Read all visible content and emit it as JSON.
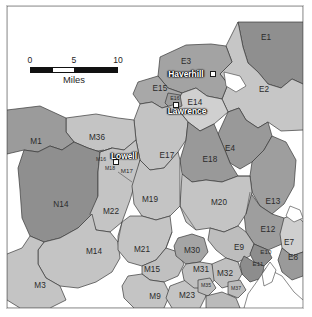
{
  "map": {
    "title": "Regional planning area map",
    "background_color": "#ffffff",
    "frame_color": "#c9c9c9",
    "boundary_color": "#3a3a3a",
    "water_color": "#ffffff",
    "palette": {
      "dark_gray": "#8f8f8f",
      "mid_gray": "#a3a3a3",
      "light_gray": "#bdbdbd",
      "pale_gray": "#cfcfcf",
      "very_light": "#d8d8d8"
    }
  },
  "scale_bar": {
    "ticks": [
      "0",
      "5",
      "10"
    ],
    "caption": "Miles",
    "units": "Miles",
    "max_value": 10
  },
  "cities": [
    {
      "name": "Haverhill",
      "x": 186,
      "y": 74,
      "dot_x": 213,
      "dot_y": 74
    },
    {
      "name": "Lawrence",
      "x": 187,
      "y": 111,
      "dot_x": 176,
      "dot_y": 105
    },
    {
      "name": "Lowell",
      "x": 124,
      "y": 156,
      "dot_x": 116,
      "dot_y": 162
    }
  ],
  "regions": [
    {
      "id": "E1",
      "label": "E1",
      "x": 266,
      "y": 38,
      "fill": "#8f8f8f",
      "size": "md"
    },
    {
      "id": "E2",
      "label": "E2",
      "x": 264,
      "y": 90,
      "fill": "#c6c6c6",
      "size": "md"
    },
    {
      "id": "E3",
      "label": "E3",
      "x": 186,
      "y": 62,
      "fill": "#a3a3a3",
      "size": "md"
    },
    {
      "id": "E4",
      "label": "E4",
      "x": 230,
      "y": 149,
      "fill": "#999999",
      "size": "md"
    },
    {
      "id": "E7",
      "label": "E7",
      "x": 289,
      "y": 243,
      "fill": "#cfcfcf",
      "size": "md"
    },
    {
      "id": "E8",
      "label": "E8",
      "x": 293,
      "y": 258,
      "fill": "#9a9a9a",
      "size": "md"
    },
    {
      "id": "E9",
      "label": "E9",
      "x": 239,
      "y": 248,
      "fill": "#bdbdbd",
      "size": "md"
    },
    {
      "id": "E10",
      "label": "E10",
      "x": 266,
      "y": 252,
      "fill": "#8d8d8d",
      "size": "sm"
    },
    {
      "id": "E11",
      "label": "E11",
      "x": 258,
      "y": 264,
      "fill": "#8d8d8d",
      "size": "sm"
    },
    {
      "id": "E12",
      "label": "E12",
      "x": 268,
      "y": 230,
      "fill": "#9e9e9e",
      "size": "md"
    },
    {
      "id": "E13",
      "label": "E13",
      "x": 273,
      "y": 202,
      "fill": "#9e9e9e",
      "size": "md"
    },
    {
      "id": "E14",
      "label": "E14",
      "x": 195,
      "y": 103,
      "fill": "#d0d0d0",
      "size": "md"
    },
    {
      "id": "E15",
      "label": "E15",
      "x": 160,
      "y": 89,
      "fill": "#a8a8a8",
      "size": "md"
    },
    {
      "id": "E16",
      "label": "E16",
      "x": 175,
      "y": 99,
      "fill": "#9d9d9d",
      "size": "xs"
    },
    {
      "id": "E17",
      "label": "E17",
      "x": 167,
      "y": 156,
      "fill": "#c3c3c3",
      "size": "md"
    },
    {
      "id": "E18",
      "label": "E18",
      "x": 210,
      "y": 160,
      "fill": "#999999",
      "size": "md"
    },
    {
      "id": "M1",
      "label": "M1",
      "x": 36,
      "y": 142,
      "fill": "#9b9b9b",
      "size": "md"
    },
    {
      "id": "M3",
      "label": "M3",
      "x": 40,
      "y": 286,
      "fill": "#c4c4c4",
      "size": "md"
    },
    {
      "id": "M9",
      "label": "M9",
      "x": 155,
      "y": 297,
      "fill": "#c4c4c4",
      "size": "md"
    },
    {
      "id": "M14",
      "label": "M14",
      "x": 94,
      "y": 252,
      "fill": "#c4c4c4",
      "size": "md"
    },
    {
      "id": "M15",
      "label": "M15",
      "x": 152,
      "y": 270,
      "fill": "#c0c0c0",
      "size": "md"
    },
    {
      "id": "M16",
      "label": "M16",
      "x": 101,
      "y": 160,
      "fill": "#b0b0b0",
      "size": "xs"
    },
    {
      "id": "M17",
      "label": "M17",
      "x": 127,
      "y": 171,
      "fill": "#b8b8b8",
      "size": "sm"
    },
    {
      "id": "M18",
      "label": "M18",
      "x": 110,
      "y": 169,
      "fill": "#ababab",
      "size": "xs"
    },
    {
      "id": "M19",
      "label": "M19",
      "x": 150,
      "y": 200,
      "fill": "#c4c4c4",
      "size": "md"
    },
    {
      "id": "M20",
      "label": "M20",
      "x": 219,
      "y": 203,
      "fill": "#c4c4c4",
      "size": "md"
    },
    {
      "id": "M21",
      "label": "M21",
      "x": 142,
      "y": 250,
      "fill": "#c4c4c4",
      "size": "md"
    },
    {
      "id": "M22",
      "label": "M22",
      "x": 111,
      "y": 212,
      "fill": "#c4c4c4",
      "size": "md"
    },
    {
      "id": "M23",
      "label": "M23",
      "x": 187,
      "y": 296,
      "fill": "#c4c4c4",
      "size": "md"
    },
    {
      "id": "M30",
      "label": "M30",
      "x": 192,
      "y": 251,
      "fill": "#a5a5a5",
      "size": "md"
    },
    {
      "id": "M31",
      "label": "M31",
      "x": 201,
      "y": 270,
      "fill": "#c0c0c0",
      "size": "md"
    },
    {
      "id": "M32",
      "label": "M32",
      "x": 225,
      "y": 274,
      "fill": "#c0c0c0",
      "size": "md"
    },
    {
      "id": "M35",
      "label": "M35",
      "x": 206,
      "y": 286,
      "fill": "#bcbcbc",
      "size": "xs"
    },
    {
      "id": "M36",
      "label": "M36",
      "x": 97,
      "y": 138,
      "fill": "#c4c4c4",
      "size": "md"
    },
    {
      "id": "M37",
      "label": "M37",
      "x": 236,
      "y": 289,
      "fill": "#bcbcbc",
      "size": "xs"
    },
    {
      "id": "N14",
      "label": "N14",
      "x": 61,
      "y": 205,
      "fill": "#8f8f8f",
      "size": "md"
    }
  ]
}
